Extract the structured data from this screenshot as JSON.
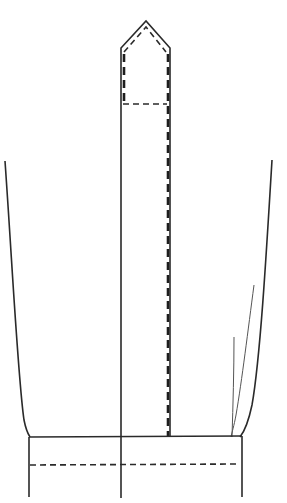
{
  "diagram": {
    "type": "sewing-pattern",
    "colors": {
      "line": "#2a2a2a",
      "background": "#ffffff"
    },
    "parts": [
      {
        "name": "placket-strip",
        "style": "solid",
        "shape": "pointed-top-rectangle"
      },
      {
        "name": "placket-topstitch",
        "style": "dashed"
      },
      {
        "name": "sleeve-left-seam",
        "style": "solid-curve"
      },
      {
        "name": "sleeve-right-seam",
        "style": "solid-curve"
      },
      {
        "name": "pleat-lines",
        "style": "thin",
        "count": 2
      },
      {
        "name": "cuff-band",
        "style": "solid"
      },
      {
        "name": "cuff-topstitch",
        "style": "dashed"
      }
    ]
  }
}
